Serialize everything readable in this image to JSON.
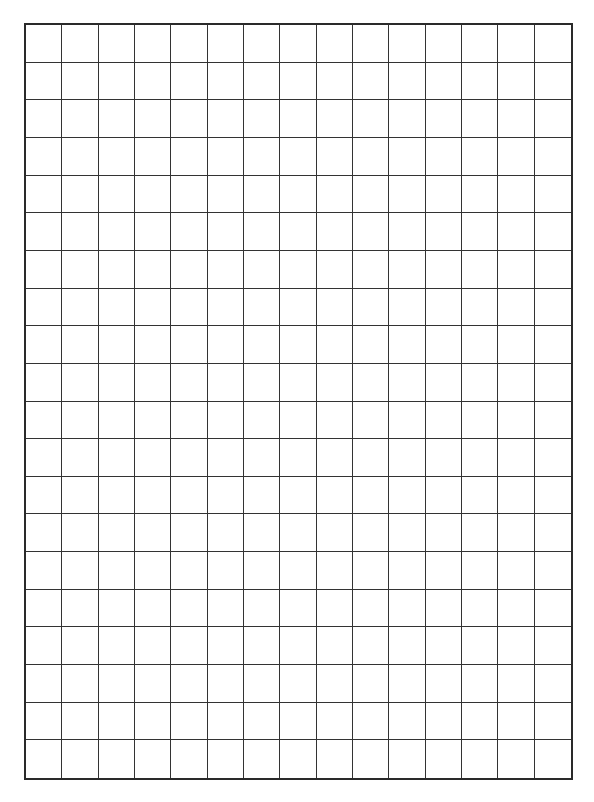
{
  "grid": {
    "columns": 15,
    "rows": 20,
    "line_color": "#333333",
    "border_color": "#2a2a2a",
    "background": "#ffffff"
  }
}
